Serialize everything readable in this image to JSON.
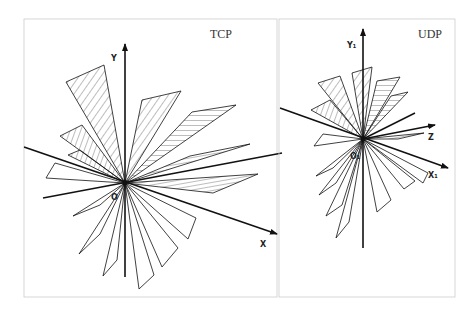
{
  "panels": [
    {
      "id": "tcp",
      "title": "TCP",
      "axes": {
        "y": "Y",
        "x": "X",
        "origin": "O"
      }
    },
    {
      "id": "udp",
      "title": "UDP",
      "axes": {
        "y": "Y₁",
        "z": "Z",
        "x": "X₁",
        "origin": "O₁"
      }
    }
  ],
  "colors": {
    "stroke": "#111111",
    "frame": "#cccccc",
    "background": "#ffffff"
  }
}
